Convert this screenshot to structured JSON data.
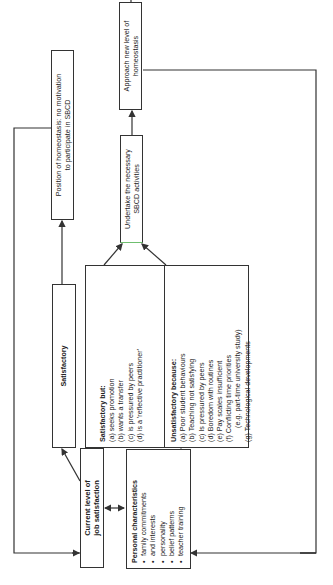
{
  "diagram": {
    "orientation": "rotated 90 degrees counter-clockwise",
    "nodes": {
      "current_level": {
        "line1": "Current level of",
        "line2": "job satisfaction"
      },
      "personal": {
        "title": "Personal characteristics",
        "items": [
          "family commitments",
          "and interests",
          "personality",
          "belief patterns",
          "teacher training"
        ]
      },
      "satisfactory": {
        "title": "Satisfactory"
      },
      "satisfactory_but": {
        "title": "Satisfactory but:",
        "items": [
          "(a) seeks promotion",
          "(b) wants a transfer",
          "(c) is pressured by peers",
          "(d) is a 'reflective practitioner'"
        ]
      },
      "unsatisfactory": {
        "title": "Unsatisfactory because:",
        "items": [
          "(a) Poor student behaviours",
          "(b) Teaching not satisfying",
          "(c) Is pressured by peers",
          "(d) Boredom with routines",
          "(e) Pay scales insufficient",
          "(f) Conflicting time priorities",
          "(e.g. part-time university study)",
          "(g) Technological developments"
        ]
      },
      "homeostasis": {
        "line1": "Position of homeostasis: no motivation",
        "line2": "to participate in SBCD"
      },
      "undertake": {
        "line1": "Undertake the necessary",
        "line2": "SBCD activities"
      },
      "approach": {
        "line1": "Approach new level of",
        "line2": "homeostasis"
      }
    },
    "colors": {
      "stroke": "#333333",
      "background": "#ffffff",
      "undertake_accent": "#6fbf6f"
    }
  }
}
